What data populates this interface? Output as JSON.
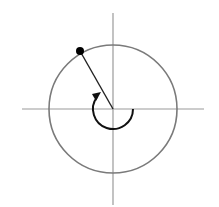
{
  "diagram": {
    "type": "unit-circle-angle",
    "center": [
      113,
      109
    ],
    "radius": 64,
    "terminal_angle_deg": 120,
    "rotation_deg": -240,
    "rotation_direction": "clockwise",
    "axes": {
      "x_axis": {
        "from": [
          22,
          109
        ],
        "to": [
          204,
          109
        ]
      },
      "y_axis": {
        "from": [
          113,
          13
        ],
        "to": [
          113,
          205
        ]
      }
    },
    "point": {
      "x": 80,
      "y": 51
    },
    "arc_radius": 20,
    "colors": {
      "axis": "#9a9a9a",
      "circle": "#7a7a7a",
      "ray": "#222222",
      "arc": "#111111",
      "point": "#000000",
      "background": "#ffffff"
    }
  }
}
